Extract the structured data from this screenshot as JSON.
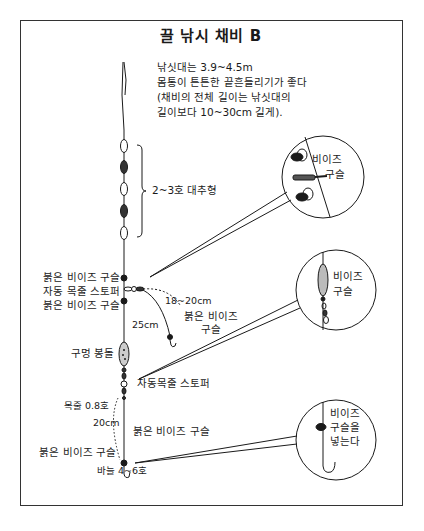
{
  "title": "끌 낚시 채비 B",
  "notes": {
    "line1": "낚싯대는 3.9~4.5m",
    "line2": "몸통이 튼튼한 끝흔들리기가 좋다",
    "line3": "(채비의 전체 길이는 낚싯대의",
    "line4": "길이보다 10~30cm 길게)."
  },
  "labels": {
    "float_group": "2~3호 대추형",
    "red_bead_upper": "붉은 비이즈 구슬",
    "auto_stopper_upper": "자동 목줄 스토퍼",
    "red_bead_lower": "붉은 비이즈 구슬",
    "branch_length": "18~20cm",
    "branch_bead_line1": "붉은 비이즈",
    "branch_bead_line2": "구슬",
    "length_25": "25cm",
    "sinker": "구멍 봉돌",
    "auto_stopper_lower": "자동목줄 스토퍼",
    "leader": "목줄 0.8호",
    "length_20": "20cm",
    "red_bead_hook_right": "붉은 비이즈 구슬",
    "red_bead_hook_left": "붉은 비이즈 구슬",
    "hook": "바늘 4~6호"
  },
  "callouts": [
    {
      "line1": "비이즈",
      "line2": "구슬"
    },
    {
      "line1": "비이즈",
      "line2": "구슬"
    },
    {
      "line1": "비이즈",
      "line2": "구슬을",
      "line3": "넣는다"
    }
  ],
  "colors": {
    "ink": "#1a1a1a",
    "frame": "#333333",
    "background": "#ffffff"
  }
}
